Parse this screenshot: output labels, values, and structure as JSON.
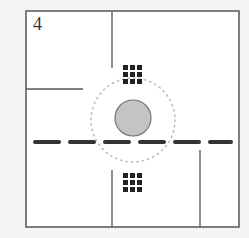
{
  "diagram": {
    "label": "4",
    "colors": {
      "background": "#f4f4f4",
      "frame_fill": "#ffffff",
      "frame_stroke": "#555555",
      "wall": "#555555",
      "dash": "#333333",
      "dot_grid": "#222222",
      "circle_fill": "#c4c4c4",
      "circle_stroke": "#777777",
      "dotted_ring": "#bbbbbb"
    },
    "frame": {
      "x": 26,
      "y": 11,
      "w": 213,
      "h": 216
    },
    "walls": [
      {
        "name": "top-vertical-wall",
        "x1": 112,
        "y1": 11,
        "x2": 112,
        "y2": 68
      },
      {
        "name": "left-horizontal-wall",
        "x1": 26,
        "y1": 89,
        "x2": 83,
        "y2": 89
      },
      {
        "name": "bottom-center-vertical-wall",
        "x1": 112,
        "y1": 170,
        "x2": 112,
        "y2": 227
      },
      {
        "name": "bottom-right-vertical-wall",
        "x1": 200,
        "y1": 150,
        "x2": 200,
        "y2": 227
      }
    ],
    "dot_grids": [
      {
        "name": "upper-dot-grid",
        "x": 123,
        "y": 65,
        "rows": 3,
        "cols": 3,
        "size": 5,
        "gap": 2
      },
      {
        "name": "lower-dot-grid",
        "x": 123,
        "y": 173,
        "rows": 3,
        "cols": 3,
        "size": 5,
        "gap": 2
      }
    ],
    "solid_circle": {
      "cx": 133,
      "cy": 118,
      "r": 18
    },
    "dotted_ring": {
      "cx": 133,
      "cy": 120,
      "r": 42
    },
    "dashed_line": {
      "y": 142,
      "x_start": 35,
      "x_end": 231,
      "dash": 24,
      "gap": 11,
      "thickness": 4
    }
  }
}
